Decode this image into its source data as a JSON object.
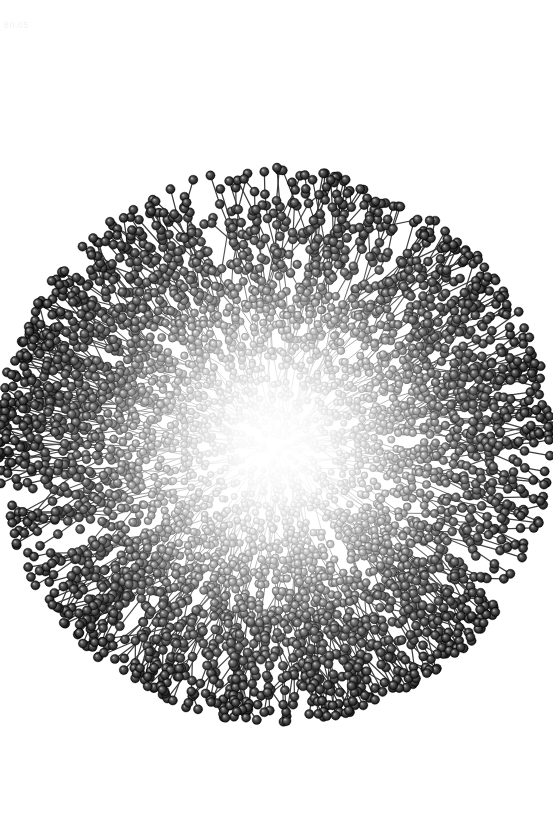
{
  "figure": {
    "kind": "molecular-structure-render",
    "style": "ball-and-stick",
    "title": "",
    "caption": "",
    "background_color": "#ffffff",
    "width": 553,
    "height": 813
  },
  "watermark": {
    "text": "80.05",
    "color": "#f2f2f2",
    "x": 4,
    "y": 20,
    "font_size": 9
  },
  "chart_data": {
    "type": "scatter",
    "title": "",
    "subtitle": "",
    "xlabel": "",
    "ylabel": "",
    "grid": false,
    "legend": null,
    "xlim": [
      0,
      553
    ],
    "ylim": [
      0,
      813
    ],
    "annotations": [],
    "structure": {
      "center_x": 275,
      "center_y": 445,
      "core_radius": 70,
      "dense_radius": 185,
      "outer_radius": 262,
      "bounds": {
        "left": 13,
        "right": 537,
        "top": 183,
        "bottom": 707
      },
      "generations": 7,
      "branches_per_node": 2,
      "root_arms": 26,
      "approx_bead_count": 4200,
      "bead_radius_min": 2.6,
      "bead_radius_max": 4.6,
      "bond_width": 0.9,
      "bond_color": "#8a8a8a"
    },
    "shading": {
      "model": "radial-depth-fog",
      "core_color": "#ffffff",
      "mid_color": "#b4b4b4",
      "rim_color": "#1a1a1a",
      "highlight_color": "#ffffff",
      "highlight_offset_x": -0.33,
      "highlight_offset_y": -0.36,
      "outline_color": "#000000"
    },
    "radial_luminance_profile": {
      "r_fraction": [
        0.0,
        0.1,
        0.2,
        0.3,
        0.4,
        0.5,
        0.6,
        0.7,
        0.8,
        0.9,
        1.0
      ],
      "mean_gray": [
        253,
        250,
        242,
        226,
        201,
        173,
        142,
        112,
        84,
        62,
        46
      ]
    },
    "radial_density_profile": {
      "r_fraction": [
        0.0,
        0.1,
        0.2,
        0.3,
        0.4,
        0.5,
        0.6,
        0.7,
        0.8,
        0.9,
        1.0
      ],
      "relative_bead_density": [
        0.04,
        0.12,
        0.34,
        0.62,
        0.88,
        1.0,
        0.93,
        0.74,
        0.48,
        0.24,
        0.08
      ]
    }
  }
}
